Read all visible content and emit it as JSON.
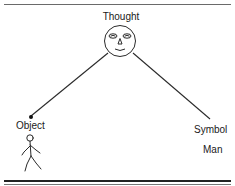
{
  "diagram": {
    "nodes": {
      "thought": {
        "label": "Thought",
        "icon": "face-icon"
      },
      "object": {
        "label": "Object",
        "icon": "stick-figure-icon"
      },
      "symbol": {
        "label": "Symbol",
        "example": "Man"
      }
    },
    "edges": [
      {
        "from": "thought",
        "to": "object"
      },
      {
        "from": "thought",
        "to": "symbol"
      }
    ],
    "colors": {
      "line": "#2a2a2a",
      "rule": "#333333",
      "background": "#ffffff"
    }
  }
}
